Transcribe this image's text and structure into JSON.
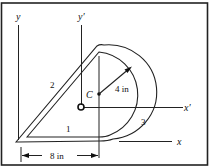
{
  "figure": {
    "axes": {
      "y": "y",
      "y_prime": "y′",
      "x": "x",
      "x_prime": "x′"
    },
    "centroid_label": "C",
    "radius_label": "4 in",
    "width_label": "8 in",
    "segment_labels": [
      "1",
      "2",
      "3"
    ]
  }
}
